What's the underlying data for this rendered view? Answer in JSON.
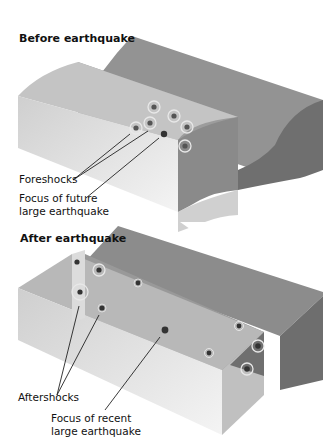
{
  "panels": [
    {
      "id": "before",
      "title": "Before earthquake",
      "labels": {
        "foreshocks": "Foreshocks",
        "focus_line1": "Focus of future",
        "focus_line2": "large earthquake"
      },
      "foreshock_count": 6
    },
    {
      "id": "after",
      "title": "After earthquake",
      "labels": {
        "aftershocks": "Aftershocks",
        "focus_line1": "Focus of recent",
        "focus_line2": "large earthquake"
      },
      "aftershock_count": 9
    }
  ],
  "colors": {
    "block_top_dark": "#8c8c8c",
    "block_side_light": "#d9d9d9",
    "block_front": "#bfbfbf",
    "fault_plane": "#9a9a9a",
    "focus_dot": "#333333",
    "shock_ring": "#e6e6e6"
  }
}
